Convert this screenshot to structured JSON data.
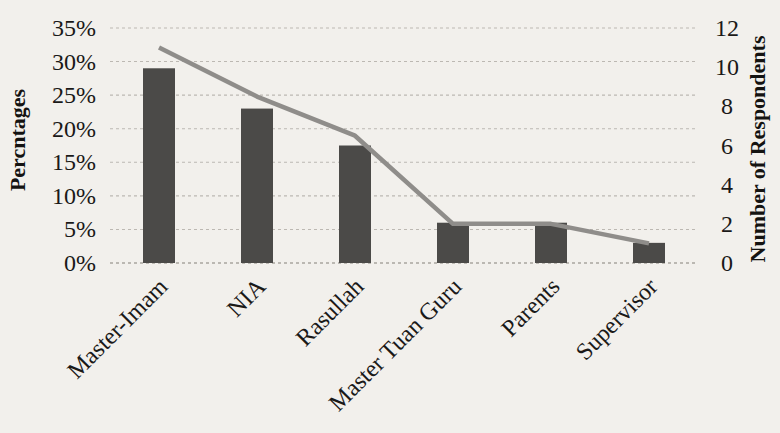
{
  "page": {
    "background_color": "#f2f0ec",
    "description_colors": {
      "bar": "#4b4a48",
      "line": "#8f8d8a",
      "gridline": "#bcb8b2",
      "baseline": "#a9a59f",
      "text": "#1a1918"
    }
  },
  "chart_data": {
    "type": "bar",
    "title": "",
    "categories": [
      "Master-Imam",
      "NIA",
      "Rasullah",
      "Master Tuan Guru",
      "Parents",
      "Supervisor"
    ],
    "series": [
      {
        "name": "Percentage of respondents",
        "render_as": "bar",
        "axis": "left",
        "unit": "%",
        "values": [
          29,
          23,
          17.5,
          6,
          6,
          3
        ],
        "color": "#4b4a48"
      },
      {
        "name": "Number of Respondents",
        "render_as": "line",
        "axis": "right",
        "unit": "respondents",
        "values": [
          11,
          8.5,
          6.5,
          2,
          2,
          1
        ],
        "color": "#8f8d8a"
      }
    ],
    "left_axis": {
      "label": "Percntages",
      "min": 0,
      "max": 35,
      "tick_step": 5,
      "tick_labels": [
        "0%",
        "5%",
        "10%",
        "15%",
        "20%",
        "25%",
        "30%",
        "35%"
      ]
    },
    "right_axis": {
      "label": "Number of Respondents",
      "min": 0,
      "max": 12,
      "tick_step": 2,
      "tick_labels": [
        "0",
        "2",
        "4",
        "6",
        "8",
        "10",
        "12"
      ]
    },
    "xlabel": "",
    "x_tick_rotation_deg": -45,
    "grid": {
      "visible": true,
      "style": "dashed",
      "color": "#bcb8b2"
    },
    "legend": {
      "visible": false
    }
  }
}
